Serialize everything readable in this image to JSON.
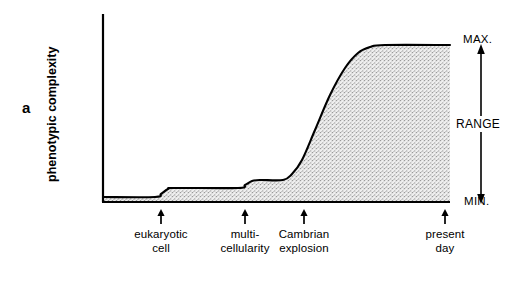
{
  "figure": {
    "panel_label": "a",
    "y_axis_label": "phenotypic complexity",
    "range_label": "RANGE",
    "max_label": "MAX.",
    "min_label": "MIN.",
    "line_color": "#000000",
    "fill_color": "#e8e8e8",
    "stipple_color": "#9a9a9a",
    "background_color": "#ffffff"
  },
  "x_events": [
    {
      "label": "eukaryotic\ncell",
      "x": 161
    },
    {
      "label": "multi-\ncellularity",
      "x": 245
    },
    {
      "label": "Cambrian\nexplosion",
      "x": 304
    },
    {
      "label": "present\nday",
      "x": 445
    }
  ],
  "chart_data": {
    "type": "area",
    "title": "",
    "xlabel": "",
    "ylabel": "phenotypic complexity",
    "grid": false,
    "legend": null,
    "axis": {
      "y_top_px": 14,
      "baseline_px": 202,
      "left_px": 103,
      "right_px": 450
    },
    "ylim": [
      "MIN.",
      "MAX."
    ],
    "y_tick_labels": [
      "MIN.",
      "MAX."
    ],
    "x_tick_labels": [
      "eukaryotic cell",
      "multi-cellularity",
      "Cambrian explosion",
      "present day"
    ],
    "annotations": [
      "RANGE"
    ],
    "series": [
      {
        "name": "phenotypic complexity",
        "description": "Stepwise then sigmoidal increase in phenotypic complexity through evolutionary time.",
        "points": [
          {
            "x": 103,
            "y": 197
          },
          {
            "x": 155,
            "y": 197
          },
          {
            "x": 161,
            "y": 194
          },
          {
            "x": 168,
            "y": 189
          },
          {
            "x": 175,
            "y": 188
          },
          {
            "x": 238,
            "y": 188
          },
          {
            "x": 245,
            "y": 185
          },
          {
            "x": 252,
            "y": 181
          },
          {
            "x": 260,
            "y": 180
          },
          {
            "x": 283,
            "y": 180
          },
          {
            "x": 292,
            "y": 174
          },
          {
            "x": 302,
            "y": 160
          },
          {
            "x": 315,
            "y": 130
          },
          {
            "x": 330,
            "y": 95
          },
          {
            "x": 345,
            "y": 68
          },
          {
            "x": 358,
            "y": 53
          },
          {
            "x": 370,
            "y": 47
          },
          {
            "x": 385,
            "y": 45
          },
          {
            "x": 450,
            "y": 45
          }
        ]
      }
    ]
  }
}
